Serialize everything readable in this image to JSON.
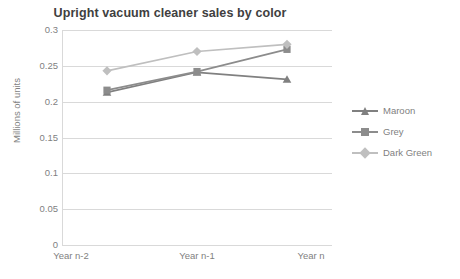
{
  "chart_data": {
    "type": "line",
    "title": "Upright vacuum cleaner sales by color",
    "xlabel": "",
    "ylabel": "Millions of units",
    "categories": [
      "Year n-2",
      "Year n-1",
      "Year n"
    ],
    "ylim": [
      0,
      0.3
    ],
    "ytick_labels": [
      "0",
      "0.05",
      "0.1",
      "0.15",
      "0.2",
      "0.25",
      "0.3"
    ],
    "ytick_values": [
      0,
      0.05,
      0.1,
      0.15,
      0.2,
      0.25,
      0.3
    ],
    "grid": true,
    "legend_position": "right",
    "series": [
      {
        "name": "Maroon",
        "color": "#808080",
        "marker": "triangle",
        "values": [
          0.213,
          0.241,
          0.231
        ]
      },
      {
        "name": "Grey",
        "color": "#8c8c8c",
        "marker": "square",
        "values": [
          0.216,
          0.242,
          0.273
        ]
      },
      {
        "name": "Dark Green",
        "color": "#bfbfbf",
        "marker": "diamond",
        "values": [
          0.243,
          0.27,
          0.28
        ]
      }
    ]
  },
  "legend": {
    "items": [
      {
        "label": "Maroon"
      },
      {
        "label": "Grey"
      },
      {
        "label": "Dark Green"
      }
    ]
  }
}
